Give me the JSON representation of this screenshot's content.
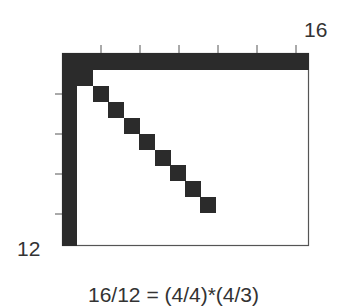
{
  "diagram": {
    "top_right_label": "16",
    "bottom_left_label": "12",
    "caption": "16/12 = (4/4)*(4/3)",
    "fill_color": "#2b2b2b",
    "frame_color": "#555555",
    "grid": {
      "columns": 16,
      "rows": 12
    },
    "frame": {
      "x": 62,
      "y": 53,
      "width": 247,
      "height": 193
    },
    "top_bar": {
      "x": 62,
      "y": 53,
      "width": 247,
      "height": 17
    },
    "left_bar": {
      "x": 62,
      "y": 53,
      "width": 15,
      "height": 193
    },
    "corner_block": {
      "x": 62,
      "y": 53,
      "width": 31,
      "height": 33
    },
    "diagonal_squares": [
      {
        "x": 93,
        "y": 86
      },
      {
        "x": 108,
        "y": 102
      },
      {
        "x": 124,
        "y": 118
      },
      {
        "x": 139,
        "y": 134
      },
      {
        "x": 155,
        "y": 150
      },
      {
        "x": 170,
        "y": 165
      },
      {
        "x": 185,
        "y": 181
      },
      {
        "x": 200,
        "y": 197
      }
    ],
    "square_size": 16,
    "top_ticks_x": [
      101,
      140,
      179,
      218,
      257,
      296
    ],
    "left_ticks_y": [
      94,
      134,
      174,
      214
    ]
  }
}
